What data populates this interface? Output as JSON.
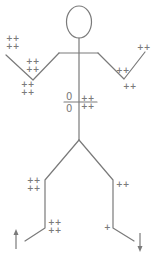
{
  "figure": {
    "type": "stick-figure-diagram",
    "stroke_color": "#7a7a7a",
    "background": "#ffffff"
  },
  "labels": {
    "chest_top": "0",
    "chest_bottom": "0",
    "plus_pair": "++",
    "plus_single": "+"
  },
  "markers": [
    {
      "region": "left-hand",
      "text": "++",
      "rows": 2
    },
    {
      "region": "left-elbow-upper",
      "text": "++",
      "rows": 2
    },
    {
      "region": "left-elbow-lower",
      "text": "++",
      "rows": 2
    },
    {
      "region": "right-elbow",
      "text": "++",
      "rows": 1
    },
    {
      "region": "right-elbow-lower",
      "text": "++",
      "rows": 1
    },
    {
      "region": "right-hand",
      "text": "++",
      "rows": 1
    },
    {
      "region": "chest-right",
      "text": "++",
      "rows": 2
    },
    {
      "region": "left-knee",
      "text": "++",
      "rows": 2
    },
    {
      "region": "left-ankle",
      "text": "++",
      "rows": 2
    },
    {
      "region": "right-knee",
      "text": "++",
      "rows": 1
    },
    {
      "region": "right-ankle",
      "text": "+",
      "rows": 1
    }
  ],
  "arrows": [
    {
      "name": "up-arrow",
      "direction": "up",
      "position": "bottom-left"
    },
    {
      "name": "down-arrow",
      "direction": "down",
      "position": "bottom-right"
    }
  ]
}
